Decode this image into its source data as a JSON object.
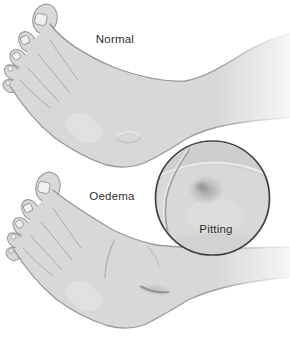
{
  "figure": {
    "labels": {
      "top": "Normal",
      "bottom": "Oedema",
      "inset": "Pitting"
    },
    "colors": {
      "background": "#ffffff",
      "skin": "#d8d8d6",
      "outline": "#8f8f8d",
      "circle_outline": "#3f3f3d",
      "pit_shadow": "#9a9a98",
      "text": "#2e2e2c"
    }
  }
}
